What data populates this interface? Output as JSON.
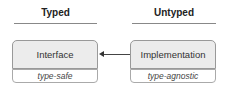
{
  "columns": [
    {
      "header": "Typed",
      "box_label": "Interface",
      "sub_label": "type-safe"
    },
    {
      "header": "Untyped",
      "box_label": "Implementation",
      "sub_label": "type-agnostic"
    }
  ],
  "arrow": {
    "from": "Implementation",
    "to": "Interface",
    "color": "#333333"
  },
  "colors": {
    "box_fill": "#ececec",
    "box_border": "#999999",
    "underline": "#888888"
  }
}
